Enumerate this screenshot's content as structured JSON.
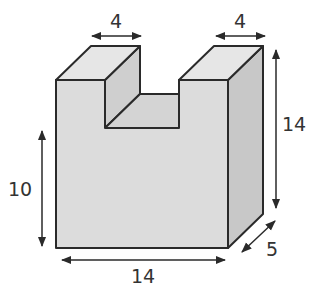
{
  "figure": {
    "type": "3D solid block with U-shaped notch (dimension diagram)",
    "colors": {
      "front_face": "#dcdcdc",
      "top_face": "#e6e6e6",
      "side_face": "#c8c8c8",
      "notch_inner": "#cfcfcf",
      "edges": "#2a2a2a",
      "labels": "#333333"
    },
    "dimensions": {
      "left_pillar_width": "4",
      "right_pillar_width": "4",
      "total_height": "14",
      "notch_depth_height": "10",
      "total_width": "14",
      "depth": "5"
    }
  }
}
